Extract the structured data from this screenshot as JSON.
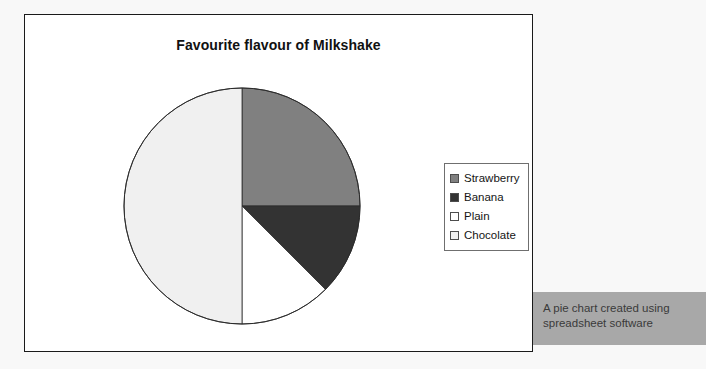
{
  "chart": {
    "title": "Favourite flavour of Milkshake",
    "legend_items": [
      {
        "label": "Strawberry",
        "color": "#808080"
      },
      {
        "label": "Banana",
        "color": "#333333"
      },
      {
        "label": "Plain",
        "color": "#ffffff"
      },
      {
        "label": "Chocolate",
        "color": "#f0f0f0"
      }
    ]
  },
  "caption": {
    "text": "A pie chart created using spreadsheet software"
  },
  "colors": {
    "strawberry": "#808080",
    "banana": "#333333",
    "plain": "#ffffff",
    "chocolate": "#f0f0f0",
    "outline": "#2b2b2b",
    "frame_border": "#1a1a1a",
    "caption_background": "#a8a8a8",
    "page_background": "#f8f8f8"
  },
  "chart_data": {
    "type": "pie",
    "title": "Favourite flavour of Milkshake",
    "xlabel": "",
    "ylabel": "",
    "legend_position": "right",
    "grid": false,
    "start_angle_deg": 0,
    "direction": "clockwise",
    "categories": [
      "Strawberry",
      "Banana",
      "Plain",
      "Chocolate"
    ],
    "values": [
      25,
      12.5,
      12.5,
      50
    ],
    "value_unit": "percent",
    "slices": [
      {
        "label": "Strawberry",
        "percent": 25,
        "start_deg": 0,
        "end_deg": 90,
        "color": "#808080"
      },
      {
        "label": "Banana",
        "percent": 12.5,
        "start_deg": 90,
        "end_deg": 135,
        "color": "#333333"
      },
      {
        "label": "Plain",
        "percent": 12.5,
        "start_deg": 135,
        "end_deg": 180,
        "color": "#ffffff"
      },
      {
        "label": "Chocolate",
        "percent": 50,
        "start_deg": 180,
        "end_deg": 360,
        "color": "#f0f0f0"
      }
    ]
  }
}
